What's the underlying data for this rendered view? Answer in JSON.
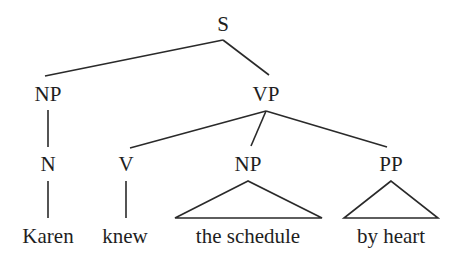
{
  "diagram": {
    "type": "syntax-tree",
    "nodes": {
      "s": {
        "label": "S"
      },
      "np_subject": {
        "label": "NP"
      },
      "vp": {
        "label": "VP"
      },
      "n": {
        "label": "N"
      },
      "v": {
        "label": "V"
      },
      "np_object": {
        "label": "NP"
      },
      "pp": {
        "label": "PP"
      }
    },
    "words": {
      "karen": "Karen",
      "knew": "knew",
      "the_schedule": "the schedule",
      "by_heart": "by heart"
    },
    "structure": "[S [NP [N Karen]] [VP [V knew] [NP the schedule] [PP by heart]]]",
    "line_color": "#2a2a2a",
    "text_color": "#1e1e1e"
  }
}
